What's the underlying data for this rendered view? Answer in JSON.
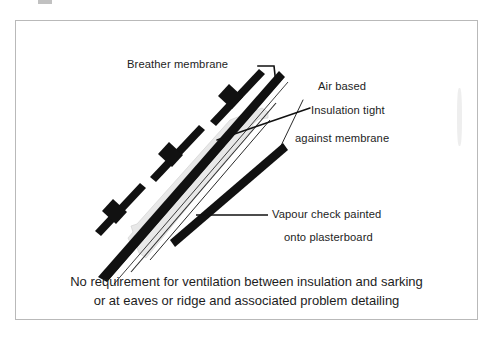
{
  "figure": {
    "frame_color": "#b9b9b9",
    "ink_color": "#111111",
    "insulation_fill": "#e8e8e8",
    "background": "#ffffff"
  },
  "labels": {
    "breather_membrane": "Breather membrane",
    "air_based": "Air based",
    "insulation_tight": "Insulation tight",
    "against_membrane": "against membrane",
    "vapour_check_line1": "Vapour check painted",
    "vapour_check_line2": "onto plasterboard"
  },
  "caption": {
    "line1": "No requirement for ventilation between insulation and sarking",
    "line2": "or at eaves or ridge and associated problem detailing"
  }
}
